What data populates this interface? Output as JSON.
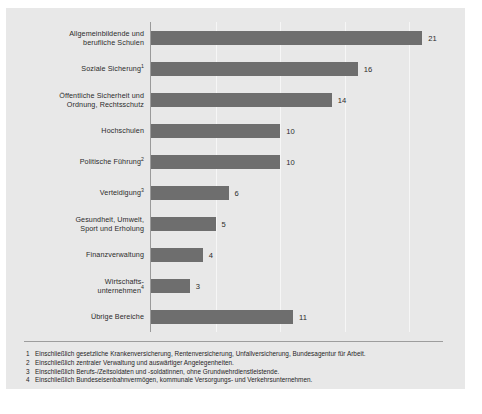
{
  "chart_data": {
    "type": "bar",
    "orientation": "horizontal",
    "title": "",
    "subtitle": "",
    "xlabel": "",
    "ylabel": "",
    "xlim": [
      0,
      24
    ],
    "grid": true,
    "legend": null,
    "bar_color": "#6e6e6e",
    "panel_color": "#e8e8e8",
    "categories": [
      "Allgemeinbildende und\nberufliche Schulen",
      "Soziale Sicherung",
      "Öffentliche Sicherheit und\nOrdnung, Rechtsschutz",
      "Hochschulen",
      "Politische Führung",
      "Verteidigung",
      "Gesundheit, Umwelt,\nSport und Erholung",
      "Finanzverwaltung",
      "Wirtschafts-\nunternehmen",
      "Übrige Bereiche"
    ],
    "category_footnote_marks": [
      "",
      "1",
      "",
      "",
      "2",
      "3",
      "",
      "",
      "4",
      ""
    ],
    "values": [
      21,
      16,
      14,
      10,
      10,
      6,
      5,
      4,
      3,
      11
    ],
    "value_labels": [
      "21",
      "16",
      "14",
      "10",
      "10",
      "6",
      "5",
      "4",
      "3",
      "11"
    ],
    "gridline_values": [
      5,
      10,
      15,
      20
    ]
  },
  "footnotes": [
    {
      "num": "1",
      "text": "Einschließlich gesetzliche Krankenversicherung, Rentenversicherung, Unfallversicherung, Bundesagentur für Arbeit."
    },
    {
      "num": "2",
      "text": "Einschließlich zentraler Verwaltung und auswärtiger Angelegenheiten."
    },
    {
      "num": "3",
      "text": "Einschließlich Berufs-/Zeitsoldaten und -soldatinnen, ohne Grundwehrdienstleistende."
    },
    {
      "num": "4",
      "text": "Einschließlich Bundeseisenbahnvermögen, kommunale Versorgungs- und Verkehrsunternehmen."
    }
  ]
}
